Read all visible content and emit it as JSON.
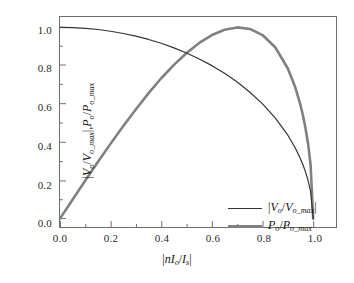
{
  "chart_data": {
    "type": "line",
    "title": "",
    "xlabel": "|nI_o/I_s|",
    "ylabel": "|V_o/V_o_max|, P_o/P_o_max",
    "xlim": [
      0.0,
      1.0
    ],
    "ylim": [
      0.0,
      1.0
    ],
    "grid": false,
    "legend_position": "inside-lower-right",
    "xticks": [
      "0.0",
      "0.2",
      "0.4",
      "0.6",
      "0.8",
      "1.0"
    ],
    "xtick_values": [
      0.0,
      0.2,
      0.4,
      0.6,
      0.8,
      1.0
    ],
    "yticks": [
      "0.0",
      "0.2",
      "0.4",
      "0.6",
      "0.8",
      "1.0"
    ],
    "ytick_values": [
      0.0,
      0.2,
      0.4,
      0.6,
      0.8,
      1.0
    ],
    "minor_ticks": true,
    "x": [
      0.0,
      0.05,
      0.1,
      0.15,
      0.2,
      0.25,
      0.3,
      0.35,
      0.4,
      0.45,
      0.5,
      0.55,
      0.6,
      0.65,
      0.7,
      0.75,
      0.8,
      0.85,
      0.9,
      0.93,
      0.95,
      0.96,
      0.97,
      0.98,
      0.99,
      1.0
    ],
    "series": [
      {
        "name": "|V_o/V_o_max|",
        "color": "#333333",
        "linewidth": 1.2,
        "values": [
          1.0,
          0.999,
          0.995,
          0.989,
          0.98,
          0.968,
          0.954,
          0.937,
          0.917,
          0.893,
          0.866,
          0.835,
          0.8,
          0.76,
          0.714,
          0.661,
          0.6,
          0.527,
          0.436,
          0.368,
          0.312,
          0.28,
          0.243,
          0.199,
          0.141,
          0.0
        ]
      },
      {
        "name": "P_o/P_o_max",
        "color": "#808080",
        "linewidth": 2.6,
        "values": [
          0.0,
          0.1,
          0.199,
          0.297,
          0.392,
          0.484,
          0.572,
          0.656,
          0.734,
          0.804,
          0.866,
          0.919,
          0.96,
          0.988,
          1.0,
          0.992,
          0.96,
          0.896,
          0.785,
          0.684,
          0.593,
          0.538,
          0.471,
          0.39,
          0.279,
          0.0
        ]
      }
    ]
  },
  "axis_labels": {
    "y_numerator_v": "V",
    "y_sub_o": "o",
    "y_sub_o_max": "o_max",
    "y_numerator_p": "P",
    "x_n": "n",
    "x_i": "I",
    "x_sub_s": "s"
  },
  "legend": {
    "items": [
      {
        "label_html": "|V_o/V_o_max|",
        "color": "#333333"
      },
      {
        "label_html": "P_o/P_o_max",
        "color": "#808080"
      }
    ]
  },
  "colors": {
    "voltage_curve": "#333333",
    "power_curve": "#808080",
    "frame": "#6e6e6e",
    "text": "#141414",
    "background": "#ffffff"
  }
}
